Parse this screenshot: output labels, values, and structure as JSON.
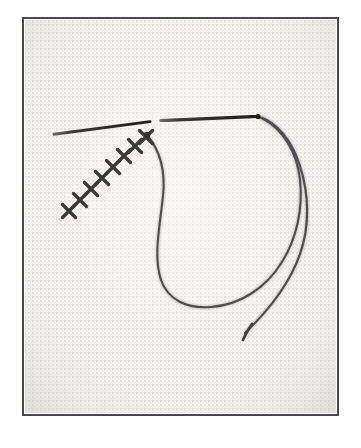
{
  "figure": {
    "caption": "A tapestry needle lies across evenweave fabric beside a completed diagonal row of cross stitches, with a long loop of working thread trailing to the right.",
    "medium": "halftone scanned photograph",
    "canvas": {
      "width": 361,
      "height": 448
    }
  },
  "colors": {
    "page_background": "#ffffff",
    "fabric_base": "#f6f5f3",
    "fabric_weave_dot": "#d9d7d4",
    "fabric_weave_line": "#e8e6e3",
    "border_stroke": "#4a4a4a",
    "needle_dark": "#2c2c2c",
    "thread_dark": "#4e4e50",
    "thread_mid": "#5d5d60",
    "stitch_dark": "#3a3a3a",
    "vignette": "#ededea"
  },
  "frame": {
    "label": "photo-border",
    "x": 23,
    "y": 18,
    "width": 315,
    "height": 397,
    "stroke_width": 2
  },
  "fabric": {
    "label": "aida-evenweave-cloth",
    "weave_pitch_px": 4,
    "x": 25,
    "y": 20,
    "width": 311,
    "height": 393
  },
  "needle": {
    "label": "tapestry-needle",
    "tip": {
      "x": 54,
      "y": 134
    },
    "eye_end": {
      "x": 258,
      "y": 117
    },
    "buried_gap": {
      "from_x": 150,
      "to_x": 161
    },
    "stroke_width_tip": 2.2,
    "stroke_width_eye": 3.4,
    "segments": [
      {
        "name": "needle-tip-segment",
        "x1": 54,
        "y1": 134,
        "x2": 150,
        "y2": 122
      },
      {
        "name": "needle-eye-segment",
        "x1": 161,
        "y1": 121,
        "x2": 258,
        "y2": 116
      }
    ]
  },
  "stitch_row": {
    "label": "completed-cross-stitch-row",
    "count": 8,
    "direction": "lower-left to upper-right",
    "stitch_size_px": 13,
    "stitches": [
      {
        "index": 1,
        "cx": 69,
        "cy": 211
      },
      {
        "index": 2,
        "cx": 80,
        "cy": 200
      },
      {
        "index": 3,
        "cx": 91,
        "cy": 189
      },
      {
        "index": 4,
        "cx": 102,
        "cy": 178
      },
      {
        "index": 5,
        "cx": 113,
        "cy": 167
      },
      {
        "index": 6,
        "cx": 124,
        "cy": 156
      },
      {
        "index": 7,
        "cx": 135,
        "cy": 146
      },
      {
        "index": 8,
        "cx": 146,
        "cy": 137
      }
    ]
  },
  "thread": {
    "label": "working-thread",
    "strands": [
      {
        "name": "thread-loop-inner",
        "description": "loop descending from the last stitch, curving down and around to the right",
        "path": "M 147 135 C 158 148 166 168 163 196 C 160 226 153 256 161 280 C 168 300 187 309 211 307 C 240 305 266 288 282 262 C 297 238 303 208 300 180 C 297 152 283 129 262 118"
      },
      {
        "name": "thread-outer-arc",
        "description": "second strand running from the needle eye down the right side to the free tail",
        "path": "M 259 117 C 277 122 292 141 300 166 C 309 194 310 226 300 254 C 290 283 270 309 245 333"
      },
      {
        "name": "thread-tail-tip",
        "description": "cut end of the thread at lower right",
        "x": 243,
        "y": 340
      }
    ]
  }
}
